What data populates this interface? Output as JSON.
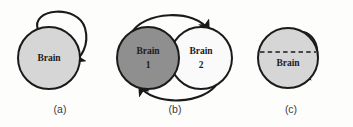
{
  "figure": {
    "background": "#fdfdfc",
    "width": 353,
    "height": 127,
    "stroke_color": "#1a1a1a"
  },
  "panels": [
    {
      "id": "a",
      "label": "(a)",
      "label_x": 60,
      "label_y": 110,
      "description": "single brain with self-loop",
      "nodes": [
        {
          "name": "brain",
          "line1": "Brain",
          "line2": "",
          "cx": 49,
          "cy": 58,
          "r": 31,
          "fill": "#d6d6d6",
          "stroke": "#1a1a1a"
        }
      ],
      "edges": [
        {
          "name": "self-loop",
          "kind": "self-loop",
          "arrowhead": true
        }
      ],
      "dashed_divider": false
    },
    {
      "id": "b",
      "label": "(b)",
      "label_x": 175,
      "label_y": 110,
      "description": "two brains with bidirectional curved arrows",
      "nodes": [
        {
          "name": "brain-1",
          "line1": "Brain",
          "line2": "1",
          "cx": 148,
          "cy": 58,
          "r": 31,
          "fill": "#8f8f8f",
          "stroke": "#1a1a1a"
        },
        {
          "name": "brain-2",
          "line1": "Brain",
          "line2": "2",
          "cx": 201,
          "cy": 58,
          "r": 31,
          "fill": "#fafafa",
          "stroke": "#1a1a1a"
        }
      ],
      "edges": [
        {
          "name": "arc-top-left-to-right",
          "kind": "arc",
          "arrowhead": true
        },
        {
          "name": "arc-bottom-right-to-left",
          "kind": "arc",
          "arrowhead": true
        }
      ],
      "dashed_divider": false
    },
    {
      "id": "c",
      "label": "(c)",
      "label_x": 291,
      "label_y": 110,
      "description": "split brain with dashed divider and self-loop",
      "nodes": [
        {
          "name": "brain",
          "line1": "Brain",
          "line2": "",
          "cx": 288,
          "cy": 58,
          "r": 30,
          "fill": "#d6d6d6",
          "stroke": "#1a1a1a"
        }
      ],
      "edges": [
        {
          "name": "self-loop",
          "kind": "self-loop-small",
          "arrowhead": true
        }
      ],
      "dashed_divider": true
    }
  ]
}
